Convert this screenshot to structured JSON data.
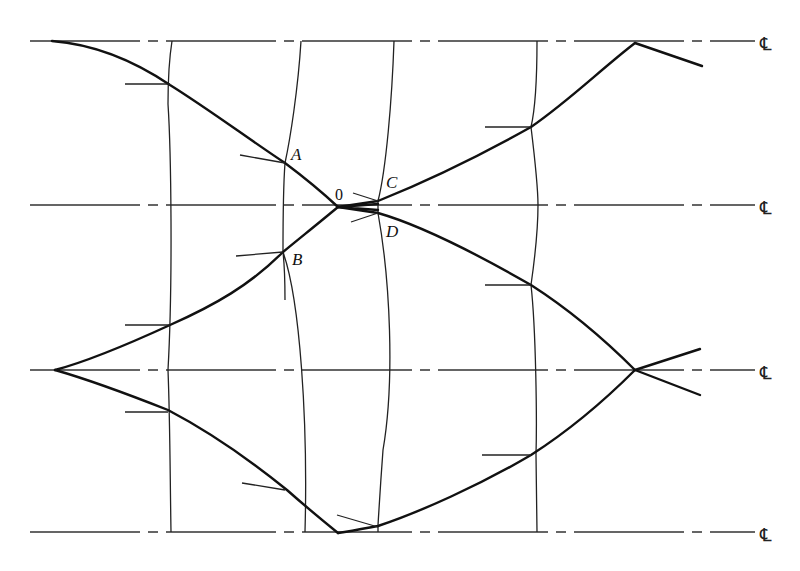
{
  "diagram": {
    "type": "nozzle wave diagram (method of characteristics)",
    "centerline_symbol": "℄",
    "centerlines_y": [
      41,
      205,
      370,
      532
    ],
    "points": {
      "A": {
        "label": "A",
        "x": 285,
        "y": 163
      },
      "B": {
        "label": "B",
        "x": 283,
        "y": 252
      },
      "O": {
        "label": "0",
        "x": 338,
        "y": 207
      },
      "C": {
        "label": "C",
        "x": 378,
        "y": 201
      },
      "D": {
        "label": "D",
        "x": 378,
        "y": 213
      }
    },
    "labels": {
      "A": "A",
      "B": "B",
      "C": "C",
      "D": "D",
      "O": "0",
      "cl1": "℄",
      "cl2": "℄",
      "cl3": "℄",
      "cl4": "℄"
    }
  }
}
